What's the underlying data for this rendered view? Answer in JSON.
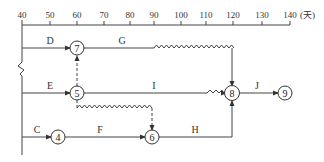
{
  "axis": {
    "ticks": [
      "40",
      "50",
      "60",
      "70",
      "80",
      "90",
      "100",
      "110",
      "120",
      "130",
      "140"
    ],
    "unit": "(天)"
  },
  "nodes": {
    "n4": "4",
    "n5": "5",
    "n6": "6",
    "n7": "7",
    "n8": "8",
    "n9": "9"
  },
  "activities": {
    "C": "C",
    "D": "D",
    "E": "E",
    "F": "F",
    "G": "G",
    "H": "H",
    "I": "I",
    "J": "J"
  },
  "diagram_data": {
    "type": "time-scaled network (double-code)",
    "time_axis": {
      "start": 40,
      "end": 140,
      "step": 10,
      "unit": "天"
    },
    "edges": [
      {
        "activity": "D",
        "from": "start",
        "to": "7",
        "start": 40,
        "end": 60
      },
      {
        "activity": "G",
        "from": "7",
        "to": "8",
        "start": 60,
        "end": 90,
        "free_float_until": 118
      },
      {
        "activity": "E",
        "from": "start",
        "to": "5",
        "start": 40,
        "end": 60
      },
      {
        "activity": "dummy",
        "from": "5",
        "to": "7",
        "type": "virtual"
      },
      {
        "activity": "I",
        "from": "5",
        "to": "8",
        "start": 60,
        "end": 110,
        "free_float_until": 118
      },
      {
        "activity": "dummy",
        "from": "5",
        "to": "6",
        "type": "virtual",
        "free_float_until": 89
      },
      {
        "activity": "C",
        "from": "start",
        "to": "4",
        "start": 40,
        "end": 53
      },
      {
        "activity": "F",
        "from": "4",
        "to": "6",
        "start": 53,
        "end": 89
      },
      {
        "activity": "H",
        "from": "6",
        "to": "8",
        "start": 89,
        "end": 118
      },
      {
        "activity": "J",
        "from": "8",
        "to": "9",
        "start": 118,
        "end": 138
      }
    ]
  }
}
